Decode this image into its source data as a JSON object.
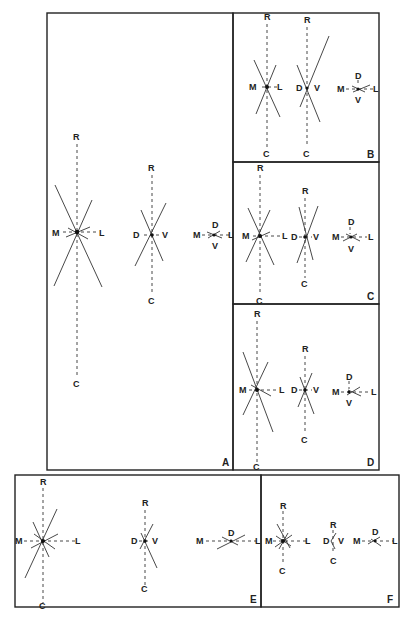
{
  "figure": {
    "axis_labels": {
      "R": "R",
      "C": "C",
      "M": "M",
      "L": "L",
      "D": "D",
      "V": "V"
    },
    "panels": [
      {
        "id": "A",
        "label": "A"
      },
      {
        "id": "B",
        "label": "B"
      },
      {
        "id": "C",
        "label": "C"
      },
      {
        "id": "D",
        "label": "D"
      },
      {
        "id": "E",
        "label": "E"
      },
      {
        "id": "F",
        "label": "F"
      }
    ],
    "stars": {
      "A1": {
        "top": "R",
        "bottom": "C",
        "left": "M",
        "right": "L"
      },
      "A2": {
        "top": "R",
        "bottom": "C",
        "left": "D",
        "right": "V"
      },
      "A3": {
        "top": "D",
        "bottom": "V",
        "left": "M",
        "right": "L"
      },
      "B1": {
        "top": "R",
        "bottom": "C",
        "left": "M",
        "right": "L"
      },
      "B2": {
        "top": "R",
        "bottom": "C",
        "left": "D",
        "right": "V"
      },
      "B3": {
        "top": "D",
        "bottom": "V",
        "left": "M",
        "right": "L"
      },
      "C1": {
        "top": "R",
        "bottom": "C",
        "left": "M",
        "right": "L"
      },
      "C2": {
        "top": "R",
        "bottom": "C",
        "left": "D",
        "right": "V"
      },
      "C3": {
        "top": "D",
        "bottom": "V",
        "left": "M",
        "right": "L"
      },
      "D1": {
        "top": "R",
        "bottom": "C",
        "left": "M",
        "right": "L"
      },
      "D2": {
        "top": "R",
        "bottom": "C",
        "left": "D",
        "right": "V"
      },
      "D3": {
        "top": "D",
        "bottom": "V",
        "left": "M",
        "right": "L"
      },
      "E1": {
        "top": "R",
        "bottom": "C",
        "left": "M",
        "right": "L"
      },
      "E2": {
        "top": "R",
        "bottom": "C",
        "left": "D",
        "right": "V"
      },
      "E3": {
        "top": "D",
        "left": "M",
        "right": "L"
      },
      "F1": {
        "top": "R",
        "bottom": "C",
        "left": "M",
        "right": "L"
      },
      "F2": {
        "top": "R",
        "bottom": "C",
        "left": "D",
        "right": "V"
      },
      "F3": {
        "top": "D",
        "left": "M",
        "right": "L"
      }
    }
  }
}
